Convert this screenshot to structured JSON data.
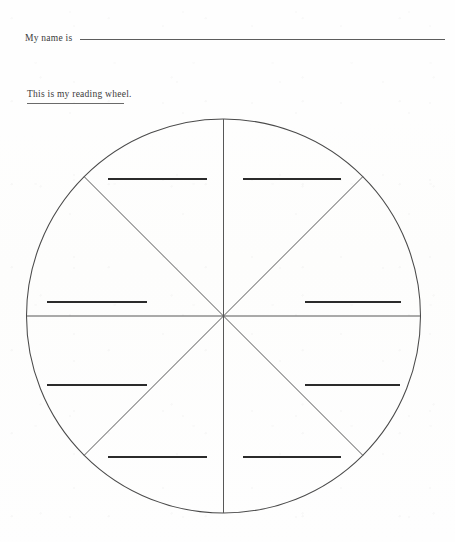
{
  "document": {
    "title": "Reading Wheel Worksheet",
    "background_color": "#fefefe",
    "ink_color": "#3a3a3a",
    "line_color": "#4a4a4a",
    "answer_line_color": "#2b2b2b"
  },
  "header": {
    "name_label": "My name is",
    "name_value": "",
    "name_rule": {
      "x_start": 78,
      "x_end": 443,
      "y": 45
    }
  },
  "subtitle": {
    "text": "This is my reading wheel.",
    "underlined": true,
    "rule_width": 97
  },
  "wheel": {
    "center_x": 223.5,
    "center_y": 316,
    "radius": 197,
    "sector_count": 8,
    "spokes": [
      {
        "name": "spoke-vertical",
        "angle_deg": 90
      },
      {
        "name": "spoke-horizontal",
        "angle_deg": 0
      },
      {
        "name": "spoke-diagonal-nw-se",
        "angle_deg": 135
      },
      {
        "name": "spoke-diagonal-ne-sw",
        "angle_deg": 45
      }
    ],
    "answer_lines": [
      {
        "id": "answer-line-top-left",
        "x1": 108,
        "x2": 207,
        "y": 179
      },
      {
        "id": "answer-line-top-right",
        "x1": 243,
        "x2": 341,
        "y": 179
      },
      {
        "id": "answer-line-middle-left",
        "x1": 47,
        "x2": 147,
        "y": 302
      },
      {
        "id": "answer-line-middle-right",
        "x1": 305,
        "x2": 401,
        "y": 302
      },
      {
        "id": "answer-line-lower-left",
        "x1": 47,
        "x2": 147,
        "y": 385
      },
      {
        "id": "answer-line-lower-right",
        "x1": 305,
        "x2": 400,
        "y": 385
      },
      {
        "id": "answer-line-bottom-left",
        "x1": 108,
        "x2": 207,
        "y": 457
      },
      {
        "id": "answer-line-bottom-right",
        "x1": 243,
        "x2": 341,
        "y": 457
      }
    ]
  }
}
